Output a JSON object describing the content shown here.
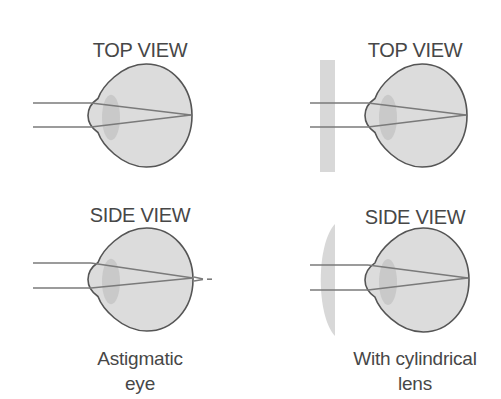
{
  "diagram": {
    "colors": {
      "background": "#ffffff",
      "eye_fill": "#dcdcdc",
      "eye_outline": "#555555",
      "inner_lens": "#c6c6c6",
      "rays": "#7a7a7a",
      "cylindrical_lens": "#d8d8d8",
      "text": "#474747"
    },
    "panels": [
      {
        "id": "astigmatic-top",
        "view_label": "TOP VIEW",
        "label_pos": [
          140,
          38
        ],
        "eye": {
          "left": 88,
          "right": 192,
          "top": 64,
          "bottom": 167,
          "focus_x": 191,
          "focus_y": 115
        },
        "rays_y": [
          103,
          127
        ],
        "ray_start_x": 33,
        "corrective_lens": null,
        "beyond_retina": false
      },
      {
        "id": "corrected-top",
        "view_label": "TOP VIEW",
        "label_pos": [
          415,
          38
        ],
        "eye": {
          "left": 365,
          "right": 467,
          "top": 64,
          "bottom": 167,
          "focus_x": 466,
          "focus_y": 115
        },
        "rays_y": [
          103,
          127
        ],
        "ray_start_x": 310,
        "corrective_lens": {
          "shape": "flat",
          "x": 320,
          "y": 60,
          "w": 15,
          "h": 112
        },
        "beyond_retina": false
      },
      {
        "id": "astigmatic-side",
        "view_label": "SIDE VIEW",
        "label_pos": [
          140,
          203
        ],
        "eye": {
          "left": 88,
          "right": 193,
          "top": 228,
          "bottom": 331,
          "focus_x": 193,
          "focus_y": 278
        },
        "rays_y": [
          263,
          288
        ],
        "ray_start_x": 33,
        "corrective_lens": null,
        "beyond_retina": true
      },
      {
        "id": "corrected-side",
        "view_label": "SIDE VIEW",
        "label_pos": [
          415,
          205
        ],
        "eye": {
          "left": 365,
          "right": 469,
          "top": 228,
          "bottom": 332,
          "focus_x": 468,
          "focus_y": 278
        },
        "rays_y": [
          265,
          290
        ],
        "ray_start_x": 310,
        "corrective_lens": {
          "shape": "plano-convex",
          "x": 320,
          "y": 224,
          "w": 15,
          "h": 112
        },
        "beyond_retina": false
      }
    ],
    "captions": [
      {
        "id": "astigmatic-caption",
        "lines": [
          "Astigmatic",
          "eye"
        ],
        "center_x": 140,
        "top": 347
      },
      {
        "id": "corrected-caption",
        "lines": [
          "With cylindrical",
          "lens"
        ],
        "center_x": 415,
        "top": 347
      }
    ]
  }
}
